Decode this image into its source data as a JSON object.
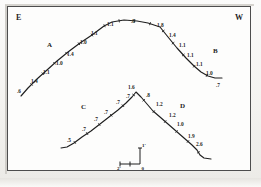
{
  "figure": {
    "background_color": "#f3f2ef",
    "frame_color": "#4d4d4d",
    "ink_color": "#1f1f1f"
  },
  "direction_markers": [
    {
      "label": "E",
      "name": "east-marker",
      "x": 16,
      "y": 14
    },
    {
      "label": "W",
      "name": "west-marker",
      "x": 235,
      "y": 14
    }
  ],
  "unit_labels": [
    {
      "label": "A",
      "name": "unit-label-a",
      "x": 47,
      "y": 42
    },
    {
      "label": "B",
      "name": "unit-label-b",
      "x": 213,
      "y": 48
    },
    {
      "label": "C",
      "name": "unit-label-c",
      "x": 81,
      "y": 104
    },
    {
      "label": "D",
      "name": "unit-label-d",
      "x": 180,
      "y": 103
    }
  ],
  "upper_profile": {
    "name": "upper-profile-curve",
    "points": "21,96 28,88 37,79 47,70 57,61 68,52 80,43 92,35 104,26 112,22 124,20 137,21 148,23 157,26 160,27 168,37 177,48 186,58 194,66 201,72 208,76 215,78 222,78",
    "annotations": [
      {
        "value": ".6",
        "x": 17,
        "y": 89
      },
      {
        "value": "1.4",
        "x": 31,
        "y": 79
      },
      {
        "value": "1.1",
        "x": 43,
        "y": 70
      },
      {
        "value": "1.0",
        "x": 56,
        "y": 61
      },
      {
        "value": "1.4",
        "x": 67,
        "y": 52
      },
      {
        "value": "1.0",
        "x": 80,
        "y": 40
      },
      {
        "value": "1.1",
        "x": 91,
        "y": 31
      },
      {
        "value": "1.1",
        "x": 107,
        "y": 22
      },
      {
        "value": ".8",
        "x": 131,
        "y": 19
      },
      {
        "value": "1.8",
        "x": 157,
        "y": 23
      },
      {
        "value": "1.4",
        "x": 169,
        "y": 33
      },
      {
        "value": "1.1",
        "x": 179,
        "y": 43
      },
      {
        "value": "1.1",
        "x": 187,
        "y": 53
      },
      {
        "value": "1.1",
        "x": 196,
        "y": 62
      },
      {
        "value": "1.0",
        "x": 206,
        "y": 71
      },
      {
        "value": ".7",
        "x": 216,
        "y": 83
      }
    ]
  },
  "lower_profile": {
    "name": "lower-profile-curve",
    "points": "61,148 67,147 74,143 82,137 91,131 100,124 109,117 118,110 126,103 132,97 136,92 141,97 147,104 153,111 160,117 168,124 176,131 184,138 192,145 197,150 200,155 204,158 211,159",
    "annotations": [
      {
        "value": ".5",
        "x": 67,
        "y": 138
      },
      {
        "value": ".7",
        "x": 82,
        "y": 127
      },
      {
        "value": ".7",
        "x": 94,
        "y": 117
      },
      {
        "value": ".7",
        "x": 104,
        "y": 110
      },
      {
        "value": ".7",
        "x": 116,
        "y": 100
      },
      {
        "value": ".7",
        "x": 126,
        "y": 94
      },
      {
        "value": "1.6",
        "x": 128,
        "y": 85
      },
      {
        "value": ".8",
        "x": 146,
        "y": 93
      },
      {
        "value": "1.2",
        "x": 156,
        "y": 102
      },
      {
        "value": "1.2",
        "x": 169,
        "y": 113
      },
      {
        "value": "1.0",
        "x": 177,
        "y": 122
      },
      {
        "value": "1.9",
        "x": 188,
        "y": 134
      },
      {
        "value": "2.6",
        "x": 196,
        "y": 142
      }
    ]
  },
  "scale_indicator": {
    "name": "scale-cross",
    "vertical_label": "1'",
    "horizontal_label": "2'",
    "origin_label": "0",
    "x": 120,
    "y": 146
  },
  "bleed_through_text": "                                        "
}
